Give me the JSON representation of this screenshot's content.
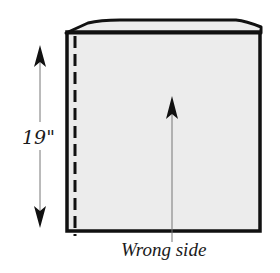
{
  "figure": {
    "type": "sewing-pattern-diagram",
    "colors": {
      "outline": "#111111",
      "fabric_fill": "#ececec",
      "background": "#ffffff",
      "guide_line": "#777777"
    }
  },
  "dimension": {
    "label": "19\"",
    "orientation": "vertical",
    "value": 19,
    "unit": "inch"
  },
  "caption": {
    "text": "Wrong side"
  },
  "stitch_line": {
    "style": "dashed",
    "position": "left edge"
  }
}
